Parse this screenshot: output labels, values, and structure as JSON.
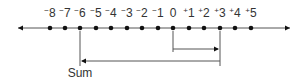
{
  "diagram": {
    "type": "number-line-addition",
    "colors": {
      "line": "#555555",
      "dot": "#111111",
      "text": "#333333",
      "background": "#ffffff"
    },
    "number_line": {
      "y": 28,
      "x_start": 18,
      "x_end": 290,
      "arrow_left": true,
      "arrow_right": true,
      "ticks": [
        {
          "value": -8,
          "sign": "−",
          "digit": "8",
          "x": 50
        },
        {
          "value": -7,
          "sign": "−",
          "digit": "7",
          "x": 65
        },
        {
          "value": -6,
          "sign": "−",
          "digit": "6",
          "x": 80
        },
        {
          "value": -5,
          "sign": "−",
          "digit": "5",
          "x": 96
        },
        {
          "value": -4,
          "sign": "−",
          "digit": "4",
          "x": 111
        },
        {
          "value": -3,
          "sign": "−",
          "digit": "3",
          "x": 127
        },
        {
          "value": -2,
          "sign": "−",
          "digit": "2",
          "x": 142
        },
        {
          "value": -1,
          "sign": "−",
          "digit": "1",
          "x": 158
        },
        {
          "value": 0,
          "sign": "",
          "digit": "0",
          "x": 173
        },
        {
          "value": 1,
          "sign": "+",
          "digit": "1",
          "x": 189
        },
        {
          "value": 2,
          "sign": "+",
          "digit": "2",
          "x": 204
        },
        {
          "value": 3,
          "sign": "+",
          "digit": "3",
          "x": 220
        },
        {
          "value": 4,
          "sign": "+",
          "digit": "4",
          "x": 235
        },
        {
          "value": 5,
          "sign": "+",
          "digit": "5",
          "x": 251
        }
      ]
    },
    "steps": [
      {
        "from": 0,
        "to": 3,
        "direction": "right",
        "y": 49,
        "drop_from_x": 173,
        "arrow_at": 3
      },
      {
        "from": 3,
        "to": -6,
        "direction": "left",
        "y": 61,
        "drop_from_x": 220,
        "arrow_at": -6
      }
    ],
    "result": {
      "value": -6,
      "label": "Sum"
    }
  }
}
